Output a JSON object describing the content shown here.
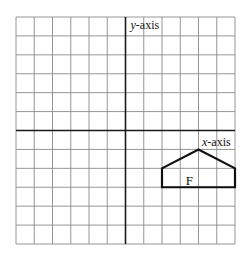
{
  "diagram": {
    "grid": {
      "columns": 12,
      "rows": 12,
      "origin_col": 6,
      "origin_row": 6
    },
    "axes": {
      "x_label_prefix": "x",
      "x_label_suffix": "-axis",
      "y_label_prefix": "y",
      "y_label_suffix": "-axis"
    },
    "shape": {
      "label": "F",
      "vertices": [
        [
          2,
          -3
        ],
        [
          2,
          -2
        ],
        [
          4,
          -1
        ],
        [
          6,
          -2
        ],
        [
          6,
          -3
        ]
      ],
      "label_position": [
        3.5,
        -2.6
      ]
    },
    "colors": {
      "grid": "#8a8a8a",
      "axis": "#1a1a1a",
      "shape": "#111111"
    }
  }
}
